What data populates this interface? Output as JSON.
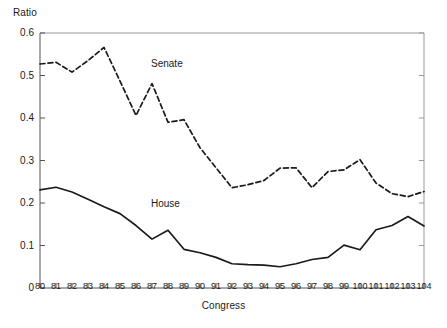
{
  "chart_data": {
    "type": "line",
    "title": "",
    "xlabel": "Congress",
    "ylabel": "Ratio",
    "xlim": [
      80,
      104
    ],
    "ylim": [
      0,
      0.6
    ],
    "grid": false,
    "legend_position": "inline-annotation",
    "x": [
      80,
      81,
      82,
      83,
      84,
      85,
      86,
      87,
      88,
      89,
      90,
      91,
      92,
      93,
      94,
      95,
      96,
      97,
      98,
      99,
      100,
      101,
      102,
      103,
      104
    ],
    "categories": [
      "80",
      "81",
      "82",
      "83",
      "84",
      "85",
      "86",
      "87",
      "88",
      "89",
      "90",
      "91",
      "92",
      "93",
      "94",
      "95",
      "96",
      "97",
      "98",
      "99",
      "100",
      "101",
      "102",
      "103",
      "104"
    ],
    "ytick_labels": [
      "0.6",
      "0.5",
      "0.4",
      "0.3",
      "0.2",
      "0.1",
      "0"
    ],
    "ytick_values": [
      0.6,
      0.5,
      0.4,
      0.3,
      0.2,
      0.1,
      0
    ],
    "series": [
      {
        "name": "Senate",
        "style": "dashed",
        "color": "#1a1a1a",
        "values": [
          0.527,
          0.531,
          0.508,
          0.535,
          0.566,
          0.487,
          0.406,
          0.481,
          0.39,
          0.396,
          0.33,
          0.283,
          0.236,
          0.243,
          0.253,
          0.282,
          0.283,
          0.236,
          0.274,
          0.278,
          0.302,
          0.247,
          0.222,
          0.215,
          0.227
        ]
      },
      {
        "name": "House",
        "style": "solid",
        "color": "#1a1a1a",
        "values": [
          0.231,
          0.237,
          0.226,
          0.209,
          0.191,
          0.175,
          0.147,
          0.115,
          0.136,
          0.091,
          0.083,
          0.072,
          0.057,
          0.055,
          0.054,
          0.05,
          0.057,
          0.067,
          0.072,
          0.101,
          0.09,
          0.137,
          0.147,
          0.168,
          0.146
        ]
      }
    ],
    "annotations": [
      {
        "text": "Senate",
        "x": 87.5,
        "y": 0.545
      },
      {
        "text": "House",
        "x": 87.5,
        "y": 0.215
      }
    ]
  }
}
